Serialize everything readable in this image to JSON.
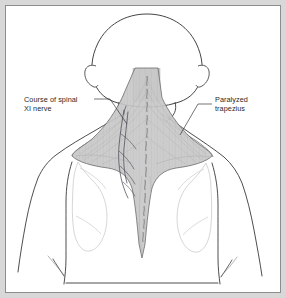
{
  "figure": {
    "kind": "anatomical-illustration",
    "background_color": "#ffffff",
    "mat_color": "#d8d8d8",
    "border_color": "#8d8d8d",
    "ink_color": "#3a3a3a",
    "muscle_fill_color": "#c9c9c9",
    "nerve_color": "#4a4a58",
    "faint_color": "#cfcfcf"
  },
  "annotations": [
    {
      "id": "nerve",
      "name": "course-of-spinal-accessory-nerve",
      "line1": "Course of spinal",
      "line2": "XI nerve",
      "side": "left",
      "leader": {
        "from_x": 88,
        "from_y": 93,
        "to_x": 120,
        "to_y": 117
      }
    },
    {
      "id": "trapezius",
      "name": "paralyzed-trapezius",
      "line1": "Paralyzed",
      "line2": "trapezius",
      "side": "right",
      "leader": {
        "from_x": 206,
        "from_y": 98,
        "to_x": 176,
        "to_y": 128
      }
    }
  ],
  "anatomy": {
    "head_label": "head",
    "left_ear_label": "left-ear",
    "right_ear_label": "right-ear",
    "neck_label": "neck",
    "trapezius_label": "trapezius-muscle",
    "spine_label": "spinal-column",
    "left_scapula_label": "left-scapula",
    "right_scapula_label": "right-scapula",
    "left_arm_label": "left-arm",
    "right_arm_label": "right-arm",
    "torso_label": "torso",
    "vertebra_count": 13
  }
}
